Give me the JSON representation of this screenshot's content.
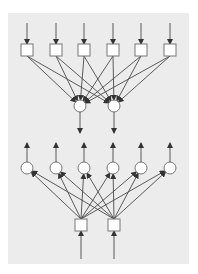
{
  "diagram": {
    "type": "neural-network-autoencoder",
    "colors": {
      "page_background": "#ffffff",
      "panel_background": "#ececec",
      "stroke": "#4a4a4a",
      "node_fill": "#ffffff",
      "node_stroke": "#777777"
    },
    "panel": {
      "x": 8,
      "y": 13,
      "width": 181,
      "height": 251
    },
    "encoder": {
      "input_nodes": {
        "shape": "square",
        "size": 12,
        "center_y": 50,
        "centers_x": [
          27,
          56,
          84,
          113,
          141,
          170
        ],
        "input_arrow_from_y": 23
      },
      "output_nodes": {
        "shape": "circle",
        "radius": 6,
        "center_y": 106,
        "centers_x": [
          80,
          114
        ],
        "output_arrow_to_y": 133
      },
      "connections": "fully-connected"
    },
    "decoder": {
      "input_nodes": {
        "shape": "square",
        "size": 12,
        "center_y": 225,
        "centers_x": [
          81,
          114
        ],
        "input_arrow_from_y": 259
      },
      "output_nodes": {
        "shape": "circle",
        "radius": 6,
        "center_y": 168,
        "centers_x": [
          27,
          56,
          84,
          113,
          141,
          170
        ],
        "output_arrow_to_y": 143
      },
      "connections": "fully-connected"
    }
  }
}
